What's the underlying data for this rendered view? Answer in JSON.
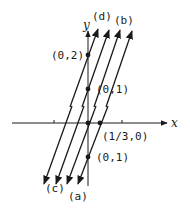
{
  "figure": {
    "axis_labels": {
      "x": "x",
      "y": "y"
    },
    "lines": [
      {
        "id": "a",
        "label": "(a)",
        "top": [
          108,
          30
        ],
        "bottom": [
          77,
          186
        ],
        "label_pos": [
          68,
          199
        ]
      },
      {
        "id": "b",
        "label": "(b)",
        "top": [
          131,
          30
        ],
        "bottom": [
          99,
          186
        ],
        "label_pos": [
          113,
          24
        ]
      },
      {
        "id": "c",
        "label": "(c)",
        "top": [
          97,
          30
        ],
        "bottom": [
          44,
          186
        ],
        "label_pos": [
          45,
          191
        ]
      },
      {
        "id": "d",
        "label": "(d)",
        "top": [
          98,
          28
        ],
        "bottom": [
          66,
          186
        ],
        "label_pos": [
          92,
          20
        ]
      }
    ],
    "points": [
      {
        "name": "point-0-2",
        "label": "(0,2)",
        "x": 88,
        "y": 55,
        "label_x": 51,
        "label_y": 59
      },
      {
        "name": "point-0-1-upper",
        "label": "(0,1)",
        "x": 88,
        "y": 89,
        "label_x": 96,
        "label_y": 93
      },
      {
        "name": "point-origin",
        "label": "",
        "x": 88,
        "y": 123
      },
      {
        "name": "point-one-third-0",
        "label": "(1/3,0)",
        "x": 100,
        "y": 123,
        "label_x": 102,
        "label_y": 140
      },
      {
        "name": "point-0-1-lower",
        "label": "(0,1)",
        "x": 88,
        "y": 157,
        "label_x": 96,
        "label_y": 161
      }
    ],
    "labels": {
      "d": "(d)",
      "b": "(b)",
      "c": "(c)",
      "a": "(a)",
      "p02": "(0,2)",
      "p01_upper": "(0,1)",
      "p_third": "(1/3,0)",
      "p01_lower": "(0,1)"
    },
    "colors": {
      "ink": "#1a1a1a",
      "background": "#ffffff"
    }
  }
}
